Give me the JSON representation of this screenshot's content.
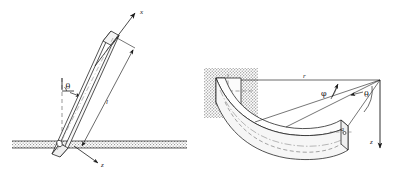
{
  "figure": {
    "background_color": "#ffffff",
    "line_color": "#1a1a1a",
    "hatch_color": "#9a9a9a",
    "width": 403,
    "height": 174
  },
  "left_diagram": {
    "name": "inclined-rod-diagram",
    "description": "Slender rod embedded in ground at an angle, with x axis along rod and z axis perpendicular",
    "labels": {
      "x_axis": "x",
      "z_axis": "z",
      "angle": "θ",
      "length": "l"
    },
    "ground": {
      "label": "ground-hatching",
      "y": 141,
      "height": 7
    }
  },
  "right_diagram": {
    "name": "curved-cantilever-beam-diagram",
    "description": "Curved beam of rectangular cross-section built into a wall, shown in 3D perspective",
    "labels": {
      "radius": "r",
      "phi_angle": "φ",
      "theta_angle": "θ",
      "z_axis": "z",
      "section_dim_fixed": "a",
      "section_dim_free": "a"
    },
    "wall": {
      "label": "wall-hatching"
    }
  }
}
